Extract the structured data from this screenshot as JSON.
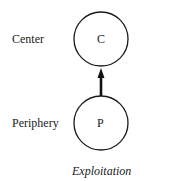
{
  "diagram": {
    "nodes": [
      {
        "id": "center",
        "row_label": "Center",
        "node_label": "C"
      },
      {
        "id": "periphery",
        "row_label": "Periphery",
        "node_label": "P"
      }
    ],
    "edges": [
      {
        "from": "periphery",
        "to": "center",
        "style": "thick-arrow"
      }
    ],
    "caption": "Exploitation"
  }
}
